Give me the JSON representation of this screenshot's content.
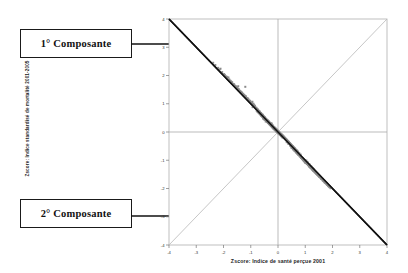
{
  "annotations": {
    "callout1": "1° Composante",
    "callout2": "2° Composante",
    "arrow1_name": "arrow-to-first-component",
    "arrow2_name": "arrow-to-second-component"
  },
  "chart_data": {
    "type": "scatter",
    "title": "",
    "xlabel": "Zscore:  Indice de santé perçue 2001",
    "ylabel": "Zscore: Indice standardisé de mortalité 2001-2005",
    "xlim": [
      -4,
      4
    ],
    "ylim": [
      -4,
      4
    ],
    "xticks": [
      -4,
      -3,
      -2,
      -1,
      0,
      1,
      2,
      3,
      4
    ],
    "yticks": [
      -4,
      -3,
      -2,
      -1,
      0,
      1,
      2,
      3,
      4
    ],
    "xticklabels": [
      "-4",
      "-3",
      "-2",
      "-1",
      "0",
      "1",
      "2",
      "3",
      "4"
    ],
    "yticklabels": [
      "-4",
      "-3",
      "-2",
      "-1",
      "0",
      "1",
      "2",
      "3",
      "4"
    ],
    "grid": false,
    "legend": "none",
    "point_color": "#8a8a8a",
    "point_size": 2,
    "point_marker": "square",
    "reference_lines": [
      {
        "name": "first-component-axis",
        "from": [
          -4,
          4
        ],
        "to": [
          4,
          -4
        ],
        "slope": -1,
        "color": "#111111",
        "width": 1.6,
        "style": "solid"
      },
      {
        "name": "second-component-axis",
        "from": [
          -4,
          -4
        ],
        "to": [
          4,
          4
        ],
        "slope": 1,
        "color": "#b8b8b8",
        "width": 0.8,
        "style": "solid"
      },
      {
        "name": "zero-vertical",
        "from": [
          0,
          -4
        ],
        "to": [
          0,
          4
        ],
        "color": "#aaaaaa",
        "width": 0.8,
        "style": "solid"
      },
      {
        "name": "zero-horizontal",
        "from": [
          -4,
          0
        ],
        "to": [
          4,
          0
        ],
        "color": "#aaaaaa",
        "width": 0.8,
        "style": "solid"
      }
    ],
    "correlation": -0.55,
    "n_points": 610,
    "x": [
      -0.24,
      0.62,
      -1.46,
      0.86,
      1.03,
      -0.54,
      0.31,
      -2.11,
      1.45,
      0.07,
      -0.93,
      0.48,
      1.72,
      -1.18,
      0.22,
      0.95,
      -0.36,
      1.21,
      -0.7,
      0.4,
      -1.82,
      0.68,
      1.38,
      -0.15,
      0.77,
      -1.05,
      0.55,
      1.9,
      -0.44,
      0.12,
      -2.38,
      0.83,
      1.14,
      -0.62,
      0.35,
      1.55,
      -0.88,
      0.19,
      1.27,
      -0.27,
      0.71,
      -1.33,
      0.58,
      1.66,
      -0.5,
      0.26,
      -1.98,
      0.9,
      1.08,
      -0.75,
      0.43,
      1.43,
      -1.12,
      0.16,
      0.99,
      -0.33,
      1.24,
      -0.66,
      0.51,
      -1.74,
      0.74,
      1.35,
      -0.2,
      0.8,
      -1.0,
      0.6,
      1.85,
      -0.4,
      0.1,
      -2.2,
      0.87,
      1.17,
      -0.58,
      0.38,
      1.5,
      -0.84,
      0.23,
      1.3,
      -0.3,
      0.65,
      -1.28,
      0.53,
      1.61,
      -0.47,
      0.29,
      -1.9,
      0.92,
      1.05,
      -0.72,
      0.45,
      1.4,
      -1.08,
      0.18,
      0.97,
      -0.37,
      1.22,
      -0.68,
      0.49,
      -1.7,
      0.76,
      1.32,
      -0.22,
      0.82,
      -0.96,
      0.63,
      1.8,
      -0.42,
      0.14,
      -2.3,
      0.89,
      1.11,
      -0.6,
      0.33,
      1.47,
      -0.8,
      0.25,
      1.19,
      -0.32,
      0.67,
      -1.24,
      0.56,
      1.58,
      -0.52,
      0.28,
      -1.86,
      0.94,
      1.02,
      -0.78,
      0.41,
      1.36,
      -1.02,
      0.2,
      1.0,
      -0.35,
      1.15,
      -0.64,
      0.47,
      -1.62,
      0.79,
      1.29,
      -0.18,
      0.84,
      -0.91,
      0.66,
      1.76,
      -0.45,
      0.08,
      -2.14,
      0.85,
      1.09,
      -0.56,
      0.3,
      1.44,
      -0.76,
      0.21,
      1.13,
      -0.28,
      0.69,
      -1.2,
      0.54,
      1.53,
      -0.49,
      0.32,
      -1.78,
      0.96,
      1.06,
      -0.74,
      0.39,
      1.33,
      -0.98,
      0.24,
      1.04,
      -0.38,
      1.1,
      -0.61,
      0.44,
      -1.56,
      0.81,
      1.26,
      -0.16,
      0.88,
      -0.86,
      0.7,
      1.7,
      -0.43,
      0.05,
      -2.05,
      0.91,
      1.07,
      -0.53,
      0.27,
      1.41,
      -0.72,
      0.17,
      1.16,
      -0.25,
      0.73,
      -1.15,
      0.5,
      1.48,
      -0.46,
      0.34,
      -1.68,
      0.98,
      1.12,
      -0.69,
      0.36,
      1.31,
      -0.94,
      0.26,
      1.01,
      -0.34,
      1.2,
      -0.57,
      0.42,
      -1.5,
      0.75,
      1.23,
      -0.13,
      0.93,
      -0.82,
      0.72,
      1.64,
      -0.39,
      0.03,
      -1.95,
      0.86,
      1.18,
      -0.51,
      0.23,
      1.37,
      -0.67,
      0.15,
      1.25,
      -0.24,
      0.78,
      -1.1,
      0.46,
      1.52,
      -0.41,
      0.37,
      -1.6,
      1.0,
      1.04,
      -0.65,
      0.31,
      1.28,
      -0.9,
      0.29,
      0.95,
      -0.31,
      1.28,
      -0.55,
      0.4,
      -1.45,
      0.68,
      1.2,
      -0.1,
      0.97,
      -0.77,
      0.74,
      1.58,
      -0.36,
      0.0,
      -1.88,
      0.8,
      1.22,
      -0.48,
      0.19,
      1.34,
      -0.63,
      0.12,
      1.31,
      -0.21,
      0.83,
      -1.04,
      0.41,
      1.56,
      -0.38,
      0.43,
      -1.52,
      1.02,
      1.0,
      -0.6,
      0.28,
      1.24,
      -0.85,
      0.33,
      0.9,
      -0.29,
      1.36,
      -0.52,
      0.38,
      -1.4,
      0.62,
      1.16,
      -0.07,
      1.01,
      -0.73,
      0.76,
      1.52,
      -0.33,
      -0.03,
      -1.8,
      0.74,
      1.26,
      -0.44,
      0.16,
      1.3,
      -0.59,
      0.09,
      1.38,
      -0.18,
      0.88,
      -0.98,
      0.37,
      1.6,
      -0.34,
      0.48,
      -1.44,
      1.05,
      0.96,
      -0.55,
      0.25,
      1.2,
      -0.8,
      0.36,
      0.85,
      -0.26,
      1.44,
      -0.48,
      0.35,
      -1.34,
      0.57,
      1.12,
      -0.04,
      1.06,
      -0.68,
      0.79,
      1.46,
      -0.3,
      -0.06,
      -1.72,
      0.68,
      1.3,
      -0.4,
      0.13,
      1.26,
      -0.54,
      0.06,
      1.45,
      -0.15,
      0.93,
      -0.92,
      0.33,
      1.64,
      -0.3,
      0.53,
      -1.36,
      1.08,
      0.92,
      -0.5,
      0.22,
      1.16,
      -0.75,
      0.39,
      0.8,
      -0.23,
      1.51,
      -0.44,
      0.32,
      -1.28,
      0.52,
      1.08,
      -0.01,
      1.1,
      -0.63,
      0.82,
      1.4,
      -0.27,
      -0.09,
      -1.64,
      0.62,
      1.34,
      -0.36,
      0.1,
      1.22,
      -0.49,
      0.03,
      1.52,
      -0.12,
      0.98,
      -0.86,
      0.29,
      1.68,
      -0.26,
      0.58,
      -1.28,
      1.12,
      0.88,
      -0.45,
      0.19,
      1.12,
      -0.7,
      0.42,
      0.75,
      -0.2,
      1.58,
      -0.4,
      0.29,
      -1.22,
      0.47,
      1.04,
      0.02,
      1.15,
      -0.58,
      0.85,
      1.34,
      -0.24,
      -0.12,
      -1.56,
      0.56,
      1.38,
      -0.32,
      0.07,
      1.18,
      -0.44,
      0.0,
      1.59,
      -0.09,
      1.03,
      -0.8,
      0.25,
      1.72,
      -0.22,
      0.63,
      -1.2,
      1.16,
      0.84,
      -0.4,
      0.16,
      1.08,
      -0.65,
      0.45,
      0.7,
      -0.17,
      1.65,
      -0.36,
      0.26,
      -1.16,
      0.42,
      1.0,
      0.05,
      1.2,
      -0.53,
      0.88,
      1.28,
      -0.21,
      -0.15,
      -1.48,
      0.5,
      1.42,
      -0.28,
      0.04,
      1.14,
      -0.39,
      -0.03,
      1.66,
      -0.06,
      1.08,
      -0.74,
      0.21,
      1.76,
      -0.18,
      0.68,
      -1.12,
      1.2,
      0.8,
      -0.35,
      0.13,
      1.04,
      -0.6,
      0.48,
      0.65,
      -0.14,
      1.72,
      -0.32,
      0.23,
      -1.1,
      0.37,
      0.96,
      0.08,
      1.25,
      -0.48,
      0.91,
      1.22,
      -0.18,
      -0.18,
      -1.4,
      0.44,
      1.46,
      -0.24,
      0.01,
      1.1,
      -0.34,
      -0.06,
      1.73,
      -0.03,
      1.13,
      -0.68,
      0.17,
      1.8,
      -0.14,
      0.73,
      -1.04,
      1.24,
      0.76,
      -0.3,
      0.1,
      1.0,
      -0.55,
      0.51,
      0.6,
      -0.11,
      1.79,
      -0.28,
      0.2,
      -1.04,
      0.32,
      0.92,
      0.11,
      1.3,
      -0.43,
      0.94,
      1.16,
      -0.15,
      -0.21,
      -1.32,
      0.38,
      1.5,
      -0.2,
      -0.02,
      1.06,
      -0.29,
      -0.09,
      1.8,
      0.0,
      1.18,
      -0.62,
      0.13,
      1.84,
      -0.1,
      0.78,
      -0.96,
      1.28,
      0.72,
      -0.25,
      0.07,
      0.96,
      -0.5,
      0.54,
      0.55,
      -0.08,
      1.86,
      -0.24,
      0.17,
      -0.98,
      0.27,
      0.88,
      0.14,
      1.35,
      -0.38,
      0.97,
      1.1,
      -0.12,
      -0.24,
      -1.24,
      0.32,
      1.54,
      -0.16,
      -0.05,
      1.02,
      -0.24,
      -0.12,
      1.87,
      0.03,
      1.23,
      -0.56,
      0.09,
      1.88,
      -0.06,
      0.83,
      -0.88,
      1.32,
      0.68,
      -0.2,
      0.04,
      0.92,
      -0.45,
      0.57,
      0.5,
      -0.05,
      1.93,
      -0.2,
      0.14,
      -0.92,
      0.22,
      0.84,
      0.17,
      1.4,
      -0.33,
      1.0,
      1.04,
      -0.09,
      -0.27,
      -1.16,
      0.26,
      1.58,
      -0.12,
      -0.08,
      0.98,
      -0.19,
      -0.15,
      1.94,
      0.06,
      1.28,
      -0.5,
      0.05,
      1.92,
      -0.02,
      0.88,
      -0.8,
      1.36,
      0.64,
      -0.15,
      0.01,
      0.88,
      -0.4,
      0.6,
      0.45,
      -0.02,
      2.0,
      -0.16,
      0.11,
      -0.86,
      0.17,
      0.8,
      0.2,
      1.45,
      -0.28,
      1.03,
      0.98,
      -0.06,
      -0.3,
      -1.08,
      0.2,
      1.62,
      -0.08,
      -0.11,
      0.94,
      -0.14,
      -0.18,
      2.01,
      0.09,
      1.33,
      -0.44,
      0.01,
      1.96,
      0.02,
      0.93,
      -0.72,
      1.4,
      0.6,
      -0.1,
      -0.02,
      0.84,
      -0.35,
      0.63,
      0.4,
      0.01,
      2.07,
      -0.12,
      0.08,
      -0.8,
      0.12,
      0.76,
      0.23,
      1.5,
      -0.23,
      1.06,
      0.92,
      -0.03
    ],
    "y": [
      0.31,
      -0.58,
      1.62,
      -0.92,
      -1.08,
      0.47,
      -0.27,
      2.24,
      -1.51,
      -0.04,
      0.88,
      -0.45,
      -1.79,
      1.26,
      -0.19,
      -1.0,
      0.33,
      -1.27,
      0.67,
      -0.37,
      1.93,
      -0.71,
      -1.44,
      0.12,
      -0.81,
      1.1,
      -0.52,
      -1.96,
      0.41,
      -0.09,
      2.45,
      -0.87,
      -1.2,
      0.59,
      -0.32,
      -1.61,
      0.93,
      -0.16,
      -1.33,
      0.24,
      -0.74,
      1.4,
      -0.55,
      -1.72,
      0.47,
      -0.23,
      2.05,
      -0.94,
      -1.13,
      0.72,
      -0.4,
      -1.49,
      1.19,
      -0.13,
      -1.04,
      0.3,
      -1.3,
      0.63,
      -0.48,
      1.81,
      -0.77,
      -1.41,
      0.17,
      -0.84,
      1.05,
      -0.57,
      -1.91,
      0.37,
      -0.07,
      2.27,
      -0.91,
      -1.23,
      0.55,
      -0.35,
      -1.56,
      0.89,
      -0.2,
      -1.36,
      0.27,
      -0.68,
      1.35,
      -0.5,
      -1.67,
      0.44,
      -0.26,
      1.97,
      -0.96,
      -1.1,
      0.69,
      -0.42,
      -1.46,
      1.15,
      -0.15,
      -1.02,
      0.34,
      -1.28,
      0.65,
      -0.46,
      1.77,
      -0.79,
      -1.38,
      0.19,
      -0.86,
      1.01,
      -0.6,
      -1.86,
      0.39,
      -0.11,
      2.37,
      -0.93,
      -1.17,
      0.57,
      -0.3,
      -1.53,
      0.85,
      -0.22,
      -1.25,
      0.29,
      -0.7,
      1.31,
      -0.53,
      -1.64,
      0.49,
      -0.25,
      1.93,
      -0.98,
      -1.07,
      0.75,
      -0.38,
      -1.42,
      1.09,
      -0.17,
      -1.05,
      0.32,
      -1.21,
      0.61,
      -0.44,
      1.69,
      -0.82,
      -1.35,
      0.15,
      -0.88,
      0.96,
      -0.63,
      -1.82,
      0.42,
      -0.05,
      2.21,
      -0.89,
      -1.14,
      0.53,
      -0.27,
      -1.5,
      0.8,
      -0.18,
      -1.18,
      0.25,
      -0.72,
      1.6,
      -0.51,
      -1.59,
      0.46,
      -0.29,
      1.85,
      -1.0,
      -1.11,
      0.71,
      -0.36,
      -1.39,
      1.03,
      -0.21,
      -1.09,
      0.35,
      -1.15,
      0.58,
      -0.41,
      1.63,
      -0.84,
      -1.32,
      0.13,
      -0.92,
      0.9,
      -0.66,
      -1.77,
      0.4,
      -0.02,
      2.12,
      -0.95,
      -1.12,
      0.5,
      -0.24,
      -1.47,
      0.76,
      -0.14,
      -1.22,
      0.22,
      -0.77,
      1.2,
      -0.48,
      -1.55,
      0.43,
      -0.31,
      1.75,
      -1.02,
      -1.17,
      0.73,
      -0.33,
      -1.37,
      1.07,
      -0.23,
      -1.06,
      0.31,
      -1.25,
      0.54,
      -0.39,
      1.57,
      -0.79,
      -1.28,
      0.1,
      -0.97,
      0.85,
      -0.69,
      -1.71,
      0.36,
      0.0,
      2.02,
      -0.9,
      -1.23,
      0.48,
      -0.2,
      -1.43,
      0.7,
      -0.12,
      -1.3,
      0.21,
      -0.81,
      1.14,
      -0.44,
      -1.58,
      0.39,
      -0.35,
      1.67,
      -1.05,
      -1.09,
      0.68,
      -0.28,
      -1.33,
      1.0,
      -0.26,
      -1.01,
      0.28,
      -1.33,
      0.58,
      -0.37,
      1.51,
      -0.72,
      -1.25,
      0.07,
      -1.02,
      0.81,
      -0.73,
      -1.64,
      0.34,
      0.03,
      1.94,
      -0.84,
      -1.27,
      0.45,
      -0.16,
      -1.4,
      0.66,
      -0.09,
      -1.36,
      0.18,
      -0.86,
      1.09,
      -0.4,
      -1.62,
      0.35,
      -0.4,
      1.59,
      -1.07,
      -1.05,
      0.63,
      -0.25,
      -1.29,
      0.93,
      -0.3,
      -0.96,
      0.25,
      -1.41,
      0.54,
      -0.34,
      1.45,
      -0.66,
      -1.21,
      0.04,
      -1.07,
      0.76,
      -0.77,
      -1.57,
      0.31,
      0.06,
      1.86,
      -0.78,
      -1.31,
      0.41,
      -0.13,
      -1.36,
      0.61,
      -0.06,
      -1.43,
      0.15,
      -0.91,
      1.03,
      -0.36,
      -1.66,
      0.31,
      -0.45,
      1.51,
      -1.1,
      -1.01,
      0.58,
      -0.22,
      -1.25,
      0.86,
      -0.34,
      -0.91,
      0.22,
      -1.49,
      0.5,
      -0.31,
      1.39,
      -0.6,
      -1.17,
      0.01,
      -1.12,
      0.71,
      -0.81,
      -1.5,
      0.28,
      0.09,
      1.78,
      -0.72,
      -1.35,
      0.37,
      -0.1,
      -1.32,
      0.56,
      -0.03,
      -1.5,
      0.12,
      -0.96,
      0.97,
      -0.32,
      -1.7,
      0.27,
      -0.5,
      1.43,
      -1.13,
      -0.97,
      0.53,
      -0.19,
      -1.21,
      0.79,
      -0.38,
      -0.86,
      0.19,
      -1.57,
      0.46,
      -0.28,
      1.33,
      -0.54,
      -1.13,
      -0.02,
      -1.17,
      0.66,
      -0.85,
      -1.43,
      0.25,
      0.12,
      1.7,
      -0.66,
      -1.39,
      0.33,
      -0.07,
      -1.28,
      0.51,
      0.0,
      -1.57,
      0.09,
      -1.01,
      0.91,
      -0.28,
      -1.74,
      0.23,
      -0.55,
      1.35,
      -1.16,
      -0.93,
      0.48,
      -0.16,
      -1.17,
      0.72,
      -0.42,
      -0.81,
      0.16,
      -1.64,
      0.42,
      -0.25,
      1.27,
      -0.48,
      -1.09,
      -0.05,
      -1.22,
      0.61,
      -0.89,
      -1.36,
      0.22,
      0.15,
      1.62,
      -0.6,
      -1.43,
      0.29,
      -0.04,
      -1.24,
      0.46,
      0.03,
      -1.64,
      0.06,
      -1.06,
      0.85,
      -0.24,
      -1.78,
      0.19,
      -0.6,
      1.27,
      -1.19,
      -0.89,
      0.43,
      -0.13,
      -1.13,
      0.65,
      -0.46,
      -0.76,
      0.13,
      -1.71,
      0.38,
      -0.22,
      1.21,
      -0.42,
      -1.05,
      -0.08,
      -1.27,
      0.56,
      -0.93,
      -1.29,
      0.19,
      0.18,
      1.54,
      -0.54,
      -1.47,
      0.25,
      -0.01,
      -1.2,
      0.41,
      0.06,
      -1.71,
      0.03,
      -1.11,
      0.79,
      -0.2,
      -1.82,
      0.15,
      -0.65,
      1.19,
      -1.22,
      -0.85,
      0.38,
      -0.1,
      -1.09,
      0.58,
      -0.5,
      -0.71,
      0.1,
      -1.78,
      0.34,
      -0.19,
      1.15,
      -0.36,
      -1.01,
      -0.11,
      -1.32,
      0.51,
      -0.97,
      -1.22,
      0.16,
      0.21,
      1.46,
      -0.48,
      -1.51,
      0.21,
      0.02,
      -1.16,
      0.36,
      0.09,
      -1.78,
      0.0,
      -1.16,
      0.73,
      -0.16,
      -1.86,
      0.11,
      -0.7,
      1.11,
      -1.25,
      -0.81,
      0.33,
      -0.07,
      -1.05,
      0.51,
      -0.54,
      -0.66,
      0.07,
      -1.85,
      0.3,
      -0.16,
      1.09,
      -0.3,
      -0.97,
      -0.14,
      -1.37,
      0.46,
      -1.01,
      -1.15,
      0.13,
      0.24,
      1.38,
      -0.42,
      -1.55,
      0.17,
      0.05,
      -1.12,
      0.31,
      0.12,
      -1.85,
      -0.03,
      -1.21,
      0.67,
      -0.12,
      -1.9,
      0.07,
      -0.75,
      1.03,
      -1.28,
      -0.77,
      0.28,
      -0.04,
      -1.01,
      0.44,
      -0.58,
      -0.61,
      0.04,
      -1.92,
      0.26,
      -0.13,
      1.03,
      -0.24,
      -0.93,
      -0.17,
      -1.42,
      0.41,
      -1.05,
      -1.08,
      0.1,
      0.27,
      1.3,
      -0.36,
      -1.59,
      0.13,
      0.08,
      -1.08,
      0.26,
      0.15,
      -1.92,
      -0.06,
      -1.26,
      0.61,
      -0.08,
      -1.94,
      0.03,
      -0.8,
      0.95,
      -1.31,
      -0.73,
      0.23,
      -0.01,
      -0.97,
      0.37,
      -0.62,
      -0.56,
      0.01,
      -1.99,
      0.22,
      -0.1,
      0.97,
      -0.18,
      -0.89,
      -0.2,
      -1.47,
      0.36,
      -1.09,
      -1.01,
      0.07
    ]
  }
}
